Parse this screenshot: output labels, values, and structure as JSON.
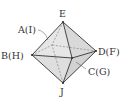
{
  "diagram": {
    "type": "octahedron",
    "colors": {
      "face": "#e4e4e4",
      "face_dark": "#d4d4d4",
      "edge": "#333333",
      "hidden_edge": "#777777"
    },
    "labels": {
      "top": "E",
      "back": "A(I)",
      "left": "B(H)",
      "right": "D(F)",
      "front": "C(G)",
      "bottom": "J"
    },
    "vertices": {
      "E": [
        63,
        22
      ],
      "A": [
        52,
        45
      ],
      "B": [
        32,
        55
      ],
      "D": [
        96,
        51
      ],
      "C": [
        72,
        58
      ],
      "J": [
        63,
        83
      ]
    }
  }
}
